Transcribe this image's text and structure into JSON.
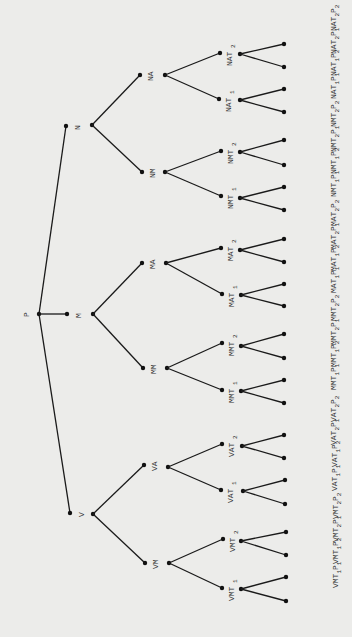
{
  "diagram": {
    "type": "tree",
    "orientation": "left-to-right",
    "colors": {
      "background": "#ececea",
      "edge": "#1a1a1a",
      "node": "#111111",
      "text": "#333333"
    },
    "root": {
      "id": "P",
      "label": "P",
      "x": 39,
      "y": 314
    },
    "level1": [
      {
        "id": "N",
        "label": "N",
        "dot": [
          66,
          126
        ],
        "branch": [
          92,
          125
        ]
      },
      {
        "id": "M",
        "label": "M",
        "dot": [
          67,
          314
        ],
        "branch": [
          93,
          314
        ]
      },
      {
        "id": "V",
        "label": "V",
        "dot": [
          70,
          513
        ],
        "branch": [
          93,
          514
        ]
      }
    ],
    "level2": [
      {
        "id": "NA",
        "label": "NA",
        "parent": "N",
        "dot": [
          140,
          75
        ],
        "branch": [
          165,
          75
        ]
      },
      {
        "id": "NM",
        "label": "NM",
        "parent": "N",
        "dot": [
          142,
          172
        ],
        "branch": [
          165,
          172
        ]
      },
      {
        "id": "MA",
        "label": "MA",
        "parent": "M",
        "dot": [
          142,
          263
        ],
        "branch": [
          166,
          263
        ]
      },
      {
        "id": "MM",
        "label": "MM",
        "parent": "M",
        "dot": [
          143,
          368
        ],
        "branch": [
          167,
          368
        ]
      },
      {
        "id": "VA",
        "label": "VA",
        "parent": "V",
        "dot": [
          144,
          465
        ],
        "branch": [
          168,
          467
        ]
      },
      {
        "id": "VM",
        "label": "VM",
        "parent": "V",
        "dot": [
          145,
          563
        ],
        "branch": [
          169,
          563
        ]
      }
    ],
    "level3": [
      {
        "id": "NAT2",
        "base": "NAT",
        "sub": "2",
        "parent": "NA",
        "dot": [
          220,
          53
        ],
        "branch": [
          240,
          54
        ]
      },
      {
        "id": "NAT1",
        "base": "NAT",
        "sub": "1",
        "parent": "NA",
        "dot": [
          219,
          99
        ],
        "branch": [
          240,
          100
        ]
      },
      {
        "id": "NMT2",
        "base": "NMT",
        "sub": "2",
        "parent": "NM",
        "dot": [
          221,
          151
        ],
        "branch": [
          240,
          152
        ]
      },
      {
        "id": "NMT1",
        "base": "NMT",
        "sub": "1",
        "parent": "NM",
        "dot": [
          221,
          196
        ],
        "branch": [
          240,
          198
        ]
      },
      {
        "id": "MAT2",
        "base": "MAT",
        "sub": "2",
        "parent": "MA",
        "dot": [
          221,
          248
        ],
        "branch": [
          240,
          250
        ]
      },
      {
        "id": "MAT1",
        "base": "MAT",
        "sub": "1",
        "parent": "MA",
        "dot": [
          222,
          294
        ],
        "branch": [
          241,
          295
        ]
      },
      {
        "id": "MMT2",
        "base": "MMT",
        "sub": "2",
        "parent": "MM",
        "dot": [
          222,
          343
        ],
        "branch": [
          241,
          346
        ]
      },
      {
        "id": "MMT1",
        "base": "MMT",
        "sub": "1",
        "parent": "MM",
        "dot": [
          222,
          390
        ],
        "branch": [
          241,
          391
        ]
      },
      {
        "id": "VAT2",
        "base": "VAT",
        "sub": "2",
        "parent": "VA",
        "dot": [
          222,
          444
        ],
        "branch": [
          242,
          446
        ]
      },
      {
        "id": "VAT1",
        "base": "VAT",
        "sub": "1",
        "parent": "VA",
        "dot": [
          221,
          490
        ],
        "branch": [
          243,
          491
        ]
      },
      {
        "id": "VMT2",
        "base": "VMT",
        "sub": "2",
        "parent": "VM",
        "dot": [
          223,
          539
        ],
        "branch": [
          241,
          541
        ]
      },
      {
        "id": "VMT1",
        "base": "VMT",
        "sub": "1",
        "parent": "VM",
        "dot": [
          222,
          588
        ],
        "branch": [
          241,
          589
        ]
      }
    ],
    "leaves": [
      {
        "base": "NAT",
        "s1": "2",
        "s2": "2",
        "parent": "NAT2",
        "pos": [
          284,
          44
        ]
      },
      {
        "base": "NAT",
        "s1": "2",
        "s2": "1",
        "parent": "NAT2",
        "pos": [
          284,
          67
        ]
      },
      {
        "base": "NAT",
        "s1": "1",
        "s2": "2",
        "parent": "NAT1",
        "pos": [
          284,
          89
        ]
      },
      {
        "base": "NAT",
        "s1": "1",
        "s2": "1",
        "parent": "NAT1",
        "pos": [
          284,
          112
        ]
      },
      {
        "base": "NMT",
        "s1": "2",
        "s2": "2",
        "parent": "NMT2",
        "pos": [
          284,
          140
        ]
      },
      {
        "base": "NMT",
        "s1": "2",
        "s2": "1",
        "parent": "NMT2",
        "pos": [
          284,
          165
        ]
      },
      {
        "base": "NMT",
        "s1": "1",
        "s2": "2",
        "parent": "NMT1",
        "pos": [
          284,
          187
        ]
      },
      {
        "base": "NMT",
        "s1": "1",
        "s2": "1",
        "parent": "NMT1",
        "pos": [
          284,
          210
        ]
      },
      {
        "base": "MAT",
        "s1": "2",
        "s2": "2",
        "parent": "MAT2",
        "pos": [
          284,
          239
        ]
      },
      {
        "base": "MAT",
        "s1": "2",
        "s2": "1",
        "parent": "MAT2",
        "pos": [
          284,
          262
        ]
      },
      {
        "base": "MAT",
        "s1": "1",
        "s2": "2",
        "parent": "MAT1",
        "pos": [
          284,
          284
        ]
      },
      {
        "base": "MAT",
        "s1": "1",
        "s2": "1",
        "parent": "MAT1",
        "pos": [
          284,
          306
        ]
      },
      {
        "base": "MMT",
        "s1": "2",
        "s2": "2",
        "parent": "MMT2",
        "pos": [
          284,
          334
        ]
      },
      {
        "base": "MMT",
        "s1": "2",
        "s2": "1",
        "parent": "MMT2",
        "pos": [
          284,
          358
        ]
      },
      {
        "base": "MMT",
        "s1": "1",
        "s2": "2",
        "parent": "MMT1",
        "pos": [
          284,
          380
        ]
      },
      {
        "base": "MMT",
        "s1": "1",
        "s2": "1",
        "parent": "MMT1",
        "pos": [
          284,
          403
        ]
      },
      {
        "base": "VAT",
        "s1": "2",
        "s2": "2",
        "parent": "VAT2",
        "pos": [
          284,
          435
        ]
      },
      {
        "base": "VAT",
        "s1": "2",
        "s2": "1",
        "parent": "VAT2",
        "pos": [
          284,
          458
        ]
      },
      {
        "base": "VAT",
        "s1": "1",
        "s2": "2",
        "parent": "VAT1",
        "pos": [
          285,
          480
        ]
      },
      {
        "base": "VAT",
        "s1": "1",
        "s2": "1",
        "parent": "VAT1",
        "pos": [
          285,
          504
        ]
      },
      {
        "base": "VMT",
        "s1": "2",
        "s2": "2",
        "parent": "VMT2",
        "pos": [
          286,
          532
        ]
      },
      {
        "base": "VMT",
        "s1": "2",
        "s2": "1",
        "parent": "VMT2",
        "pos": [
          286,
          555
        ]
      },
      {
        "base": "VMT",
        "s1": "1",
        "s2": "2",
        "parent": "VMT1",
        "pos": [
          286,
          577
        ]
      },
      {
        "base": "VMT",
        "s1": "1",
        "s2": "1",
        "parent": "VMT1",
        "pos": [
          286,
          601
        ]
      }
    ],
    "leaf_letter": "P"
  }
}
